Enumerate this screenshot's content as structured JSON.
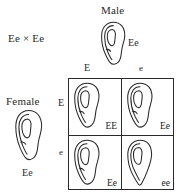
{
  "diagram": {
    "cross_label": "Ee × Ee",
    "parents": {
      "male": {
        "title": "Male",
        "genotype": "Ee",
        "icon": "ear-free-lobe-icon"
      },
      "female": {
        "title": "Female",
        "genotype": "Ee",
        "icon": "ear-free-lobe-icon"
      }
    },
    "gametes": {
      "columns": [
        "E",
        "e"
      ],
      "rows": [
        "E",
        "e"
      ]
    },
    "punnett_cells": [
      {
        "position": "top-left",
        "genotype": "EE",
        "icon": "ear-free-lobe-icon"
      },
      {
        "position": "top-right",
        "genotype": "Ee",
        "icon": "ear-free-lobe-icon"
      },
      {
        "position": "bottom-left",
        "genotype": "Ee",
        "icon": "ear-free-lobe-icon"
      },
      {
        "position": "bottom-right",
        "genotype": "ee",
        "icon": "ear-attached-lobe-icon"
      }
    ],
    "colors": {
      "ink": "#2a2a2a",
      "background": "#ffffff"
    }
  }
}
